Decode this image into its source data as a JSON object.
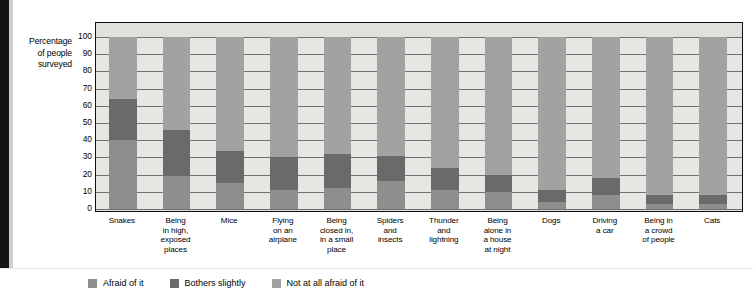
{
  "axis_title": [
    "Percentage",
    "of people",
    "surveyed"
  ],
  "legend": {
    "items": [
      {
        "label": "Afraid of it",
        "color": "#8e8e8e",
        "key": "afraid"
      },
      {
        "label": "Bothers slightly",
        "color": "#6a6a6a",
        "key": "bothers"
      },
      {
        "label": "Not at all afraid of it",
        "color": "#a2a2a2",
        "key": "not_at_all"
      }
    ]
  },
  "chart_data": {
    "type": "bar",
    "subtype": "stacked-percentage",
    "title": "",
    "xlabel": "",
    "ylabel": "Percentage of people surveyed",
    "ylim": [
      0,
      100
    ],
    "yticks": [
      0,
      10,
      20,
      30,
      40,
      50,
      60,
      70,
      80,
      90,
      100
    ],
    "grid": true,
    "legend_position": "bottom-left",
    "categories": [
      "Snakes",
      "Being in high, exposed places",
      "Mice",
      "Flying on an airplane",
      "Being closed in, in a small place",
      "Spiders and insects",
      "Thunder and lightning",
      "Being alone in a house at night",
      "Dogs",
      "Driving a car",
      "Being in a crowd of people",
      "Cats"
    ],
    "category_lines": [
      [
        "Snakes"
      ],
      [
        "Being",
        "in high,",
        "exposed",
        "places"
      ],
      [
        "Mice"
      ],
      [
        "Flying",
        "on an",
        "airplane"
      ],
      [
        "Being",
        "closed in,",
        "in a small",
        "place"
      ],
      [
        "Spiders",
        "and",
        "insects"
      ],
      [
        "Thunder",
        "and",
        "lightning"
      ],
      [
        "Being",
        "alone in",
        "a house",
        "at night"
      ],
      [
        "Dogs"
      ],
      [
        "Driving",
        "a car"
      ],
      [
        "Being in",
        "a crowd",
        "of people"
      ],
      [
        "Cats"
      ]
    ],
    "series": [
      {
        "name": "Afraid of it",
        "color": "#8e8e8e",
        "values": [
          40,
          19,
          15,
          11,
          12,
          16,
          11,
          10,
          4,
          8,
          3,
          3
        ]
      },
      {
        "name": "Bothers slightly",
        "color": "#6a6a6a",
        "values": [
          24,
          27,
          19,
          19,
          20,
          15,
          13,
          10,
          7,
          10,
          5,
          5
        ]
      },
      {
        "name": "Not at all afraid of it",
        "color": "#a2a2a2",
        "values": [
          36,
          54,
          66,
          70,
          68,
          69,
          76,
          80,
          89,
          82,
          92,
          92
        ]
      }
    ]
  }
}
